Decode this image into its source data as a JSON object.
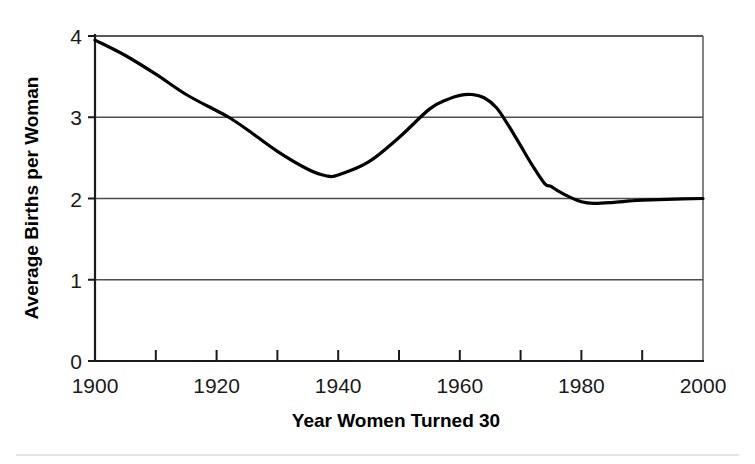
{
  "chart_data": {
    "type": "line",
    "title": "",
    "xlabel": "Year Women Turned 30",
    "ylabel": "Average Births per Woman",
    "xlim": [
      1900,
      2000
    ],
    "ylim": [
      0,
      4
    ],
    "xticks": [
      1900,
      1920,
      1940,
      1960,
      1980,
      2000
    ],
    "xtick_labels": [
      "1900",
      "1920",
      "1940",
      "1960",
      "1980",
      "2000"
    ],
    "xminor_ticks": [
      1910,
      1930,
      1950,
      1970,
      1990
    ],
    "yticks": [
      0,
      1,
      2,
      3,
      4
    ],
    "ytick_labels": [
      "0",
      "1",
      "2",
      "3",
      "4"
    ],
    "grid": "horizontal",
    "legend": "none",
    "line_color": "#000000",
    "line_width": 3.2,
    "series": [
      {
        "name": "Average Births per Woman",
        "x": [
          1900,
          1905,
          1910,
          1915,
          1920,
          1922,
          1925,
          1930,
          1935,
          1938,
          1940,
          1945,
          1950,
          1955,
          1958,
          1960,
          1962,
          1964,
          1966,
          1968,
          1970,
          1972,
          1974,
          1975,
          1976,
          1978,
          1980,
          1982,
          1985,
          1988,
          1990,
          1994,
          2000
        ],
        "y": [
          3.95,
          3.76,
          3.53,
          3.28,
          3.08,
          3.0,
          2.85,
          2.58,
          2.36,
          2.28,
          2.29,
          2.45,
          2.75,
          3.1,
          3.22,
          3.27,
          3.28,
          3.24,
          3.12,
          2.9,
          2.65,
          2.4,
          2.18,
          2.15,
          2.1,
          2.02,
          1.96,
          1.94,
          1.95,
          1.97,
          1.98,
          1.99,
          2.0
        ]
      }
    ]
  },
  "footer": {
    "rule": ""
  }
}
